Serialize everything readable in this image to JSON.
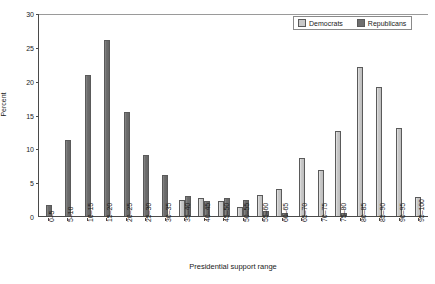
{
  "chart_data": {
    "type": "bar",
    "title": "",
    "xlabel": "Presidential support range",
    "ylabel": "Percent",
    "ylim": [
      0,
      30
    ],
    "yticks": [
      0,
      5,
      10,
      15,
      20,
      25,
      30
    ],
    "grid": false,
    "legend_position": "top-right",
    "categories": [
      "0–5",
      "5–10",
      "10–15",
      "15–20",
      "20–25",
      "25–30",
      "30–35",
      "35–40",
      "40–45",
      "45–50",
      "50–55",
      "55–60",
      "60–65",
      "65–70",
      "70–75",
      "75–80",
      "80–85",
      "85–90",
      "90–95",
      "95–100"
    ],
    "series": [
      {
        "name": "Democrats",
        "color": "#c9c9c9",
        "values": [
          0,
          0,
          0,
          0,
          0,
          0,
          0,
          2.3,
          2.6,
          2.2,
          1.4,
          3.1,
          4.0,
          8.5,
          6.8,
          12.5,
          22.0,
          19.0,
          13.0,
          2.8
        ]
      },
      {
        "name": "Republicans",
        "color": "#6e6e6e",
        "values": [
          1.6,
          11.3,
          20.8,
          26.0,
          15.4,
          9.0,
          6.1,
          2.9,
          2.2,
          2.6,
          2.3,
          0.7,
          0.5,
          0,
          0,
          0.5,
          0,
          0,
          0,
          0
        ]
      }
    ]
  },
  "legend": {
    "democrats_label": "Democrats",
    "republicans_label": "Republicans"
  }
}
